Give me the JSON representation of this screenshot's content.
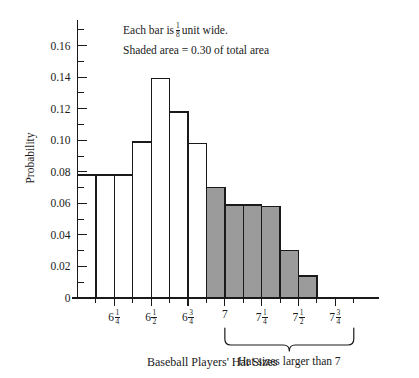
{
  "chart_data": {
    "type": "bar",
    "title": "",
    "xlabel": "Baseball Players' Hat Sizes",
    "ylabel": "Probability",
    "ylim": [
      0,
      0.175
    ],
    "grid": false,
    "legend": "none",
    "bar_width_units": 0.125,
    "categories": [
      "6 1/8 - 6 1/4",
      "6 1/4 - 6 3/8",
      "6 3/8 - 6 1/2",
      "6 1/2 - 6 5/8",
      "6 5/8 - 6 3/4",
      "6 3/4 - 6 7/8",
      "6 7/8 - 7",
      "7 - 7 1/8",
      "7 1/8 - 7 1/4",
      "7 1/4 - 7 3/8",
      "7 3/8 - 7 1/2",
      "7 1/2 - 7 5/8",
      "7 5/8 - 7 3/4"
    ],
    "values": [
      0.078,
      0.078,
      0.078,
      0.099,
      0.139,
      0.118,
      0.098,
      0.07,
      0.059,
      0.059,
      0.058,
      0.03,
      0.014
    ],
    "shaded": [
      false,
      false,
      false,
      false,
      false,
      false,
      false,
      true,
      true,
      true,
      true,
      true,
      true
    ],
    "shaded_total": 0.3,
    "bar_fill_plain": "#ffffff",
    "bar_fill_shaded": "#9b9b9b",
    "bar_stroke": "#1a1a1a",
    "y_ticks_major": [
      {
        "value": 0,
        "label": "0"
      },
      {
        "value": 0.02,
        "label": "0.02"
      },
      {
        "value": 0.04,
        "label": "0.04"
      },
      {
        "value": 0.06,
        "label": "0.06"
      },
      {
        "value": 0.08,
        "label": "0.08"
      },
      {
        "value": 0.1,
        "label": "0.10"
      },
      {
        "value": 0.12,
        "label": "0.12"
      },
      {
        "value": 0.14,
        "label": "0.14"
      },
      {
        "value": 0.16,
        "label": "0.16"
      }
    ],
    "y_ticks_minor": [
      0.01,
      0.03,
      0.05,
      0.07,
      0.09,
      0.11,
      0.13,
      0.15,
      0.17
    ],
    "x_ticks_major": [
      {
        "value": 6.25,
        "whole": "6",
        "num": "1",
        "den": "4"
      },
      {
        "value": 6.5,
        "whole": "6",
        "num": "1",
        "den": "2"
      },
      {
        "value": 6.75,
        "whole": "6",
        "num": "3",
        "den": "4"
      },
      {
        "value": 7.0,
        "whole": "7",
        "num": "",
        "den": ""
      },
      {
        "value": 7.25,
        "whole": "7",
        "num": "1",
        "den": "4"
      },
      {
        "value": 7.5,
        "whole": "7",
        "num": "1",
        "den": "2"
      },
      {
        "value": 7.75,
        "whole": "7",
        "num": "3",
        "den": "4"
      }
    ],
    "x_ticks_minor": [
      6.125,
      6.375,
      6.625,
      6.875,
      7.125,
      7.375,
      7.625,
      7.875
    ],
    "x_domain": [
      6.0,
      7.9375
    ],
    "annotations": [
      {
        "id": "bar-width-note",
        "prefix": "Each bar is",
        "frac_num": "1",
        "frac_den": "8",
        "suffix": "unit wide."
      },
      {
        "id": "shaded-area-note",
        "text": "Shaded area = 0.30 of total area"
      }
    ],
    "brace": {
      "label": "Hat sizes larger than 7",
      "from": 7.0,
      "to": 7.875
    }
  }
}
